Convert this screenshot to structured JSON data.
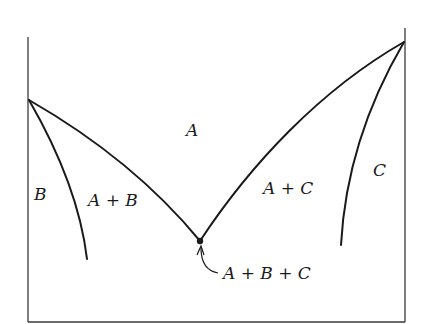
{
  "diagram": {
    "type": "ternary-phase-diagram-section",
    "regions": {
      "A": "A",
      "B": "B",
      "C": "C",
      "A_plus_B": "A + B",
      "A_plus_C": "A + C",
      "A_plus_B_plus_C": "A + B + C"
    },
    "points": {
      "left_apex": [
        29,
        100
      ],
      "right_apex": [
        404,
        42
      ],
      "eutectic": [
        200,
        241
      ]
    },
    "colors": {
      "line": "#1a1a1a",
      "axis": "#3a3a3a",
      "background": "#ffffff"
    }
  }
}
